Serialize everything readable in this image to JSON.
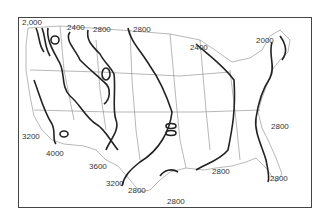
{
  "map": {
    "type": "contour map of the contiguous United States",
    "labels": [
      {
        "text": "2,000",
        "x": 22,
        "y": 19
      },
      {
        "text": "2400",
        "x": 67,
        "y": 24
      },
      {
        "text": "2800",
        "x": 93,
        "y": 26
      },
      {
        "text": "2800",
        "x": 133,
        "y": 26
      },
      {
        "text": "2400",
        "x": 190,
        "y": 44
      },
      {
        "text": "2000",
        "x": 256,
        "y": 37
      },
      {
        "text": "3200",
        "x": 22,
        "y": 133
      },
      {
        "text": "4000",
        "x": 46,
        "y": 150
      },
      {
        "text": "3600",
        "x": 89,
        "y": 163
      },
      {
        "text": "3200",
        "x": 106,
        "y": 180
      },
      {
        "text": "2800",
        "x": 128,
        "y": 187
      },
      {
        "text": "2800",
        "x": 167,
        "y": 198
      },
      {
        "text": "2800",
        "x": 212,
        "y": 168
      },
      {
        "text": "2800",
        "x": 271,
        "y": 123
      },
      {
        "text": "2800",
        "x": 270,
        "y": 175
      }
    ]
  }
}
